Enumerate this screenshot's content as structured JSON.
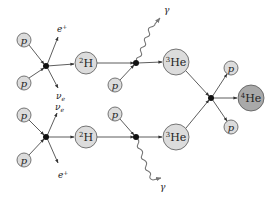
{
  "colors": {
    "node_fill": "#dcdcdc",
    "helium4_fill": "#a9a9a9",
    "node_stroke": "#555555",
    "vertex": "#111111",
    "line": "#333333",
    "photon": "#777777"
  },
  "particles": {
    "proton": "p",
    "positron": "e",
    "positron_sup": "+",
    "neutrino": "ν",
    "neutrino_sub": "e",
    "photon": "γ"
  },
  "nuclei": {
    "deuterium": {
      "mass": "2",
      "symbol": "H"
    },
    "helium3": {
      "mass": "3",
      "symbol": "He"
    },
    "helium4": {
      "mass": "4",
      "symbol": "He"
    }
  },
  "nodes": [
    {
      "id": "p1",
      "label": "p",
      "x": 24,
      "y": 40,
      "r": 7
    },
    {
      "id": "p2",
      "label": "p",
      "x": 24,
      "y": 83,
      "r": 7
    },
    {
      "id": "H2a",
      "label": "2H",
      "x": 86,
      "y": 63,
      "r": 11
    },
    {
      "id": "p3",
      "label": "p",
      "x": 115,
      "y": 85,
      "r": 7
    },
    {
      "id": "He3a",
      "label": "3He",
      "x": 176,
      "y": 62,
      "r": 13
    },
    {
      "id": "p4",
      "label": "p",
      "x": 24,
      "y": 115,
      "r": 7
    },
    {
      "id": "p5",
      "label": "p",
      "x": 24,
      "y": 160,
      "r": 7
    },
    {
      "id": "H2b",
      "label": "2H",
      "x": 86,
      "y": 137,
      "r": 11
    },
    {
      "id": "p6",
      "label": "p",
      "x": 115,
      "y": 114,
      "r": 7
    },
    {
      "id": "He3b",
      "label": "3He",
      "x": 176,
      "y": 137,
      "r": 13
    },
    {
      "id": "p7",
      "label": "p",
      "x": 231,
      "y": 68,
      "r": 7
    },
    {
      "id": "p8",
      "label": "p",
      "x": 231,
      "y": 127,
      "r": 7
    },
    {
      "id": "He4",
      "label": "4He",
      "x": 251,
      "y": 98,
      "r": 13
    }
  ],
  "vertices": [
    {
      "id": "v1",
      "x": 46,
      "y": 66
    },
    {
      "id": "v2",
      "x": 136,
      "y": 63
    },
    {
      "id": "v3",
      "x": 46,
      "y": 137
    },
    {
      "id": "v4",
      "x": 136,
      "y": 137
    },
    {
      "id": "v5",
      "x": 211,
      "y": 98
    }
  ]
}
